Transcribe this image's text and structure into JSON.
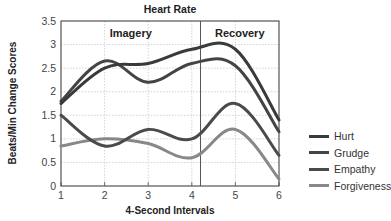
{
  "chart_data": {
    "type": "line",
    "title": "Heart Rate",
    "xlabel": "4-Second Intervals",
    "ylabel": "Beats/Min Change Scores",
    "x": [
      1,
      2,
      3,
      4,
      5,
      6
    ],
    "xlim": [
      1,
      6
    ],
    "ylim": [
      0,
      3.5
    ],
    "yticks": [
      "0",
      "0.5",
      "1",
      "1.5",
      "2",
      "2.5",
      "3",
      "3.5"
    ],
    "xticks": [
      "1",
      "2",
      "3",
      "4",
      "5",
      "6"
    ],
    "grid": true,
    "legend_position": "right",
    "annotations": [
      {
        "text": "Imagery",
        "region": "x 1 to 4.2"
      },
      {
        "text": "Recovery",
        "region": "x 4.2 to 6"
      }
    ],
    "divider_x": 4.2,
    "series": [
      {
        "name": "Hurt",
        "color": "#3a3a3a",
        "values": [
          1.75,
          2.5,
          2.6,
          2.9,
          2.9,
          1.4
        ]
      },
      {
        "name": "Grudge",
        "color": "#444444",
        "values": [
          1.8,
          2.65,
          2.2,
          2.6,
          2.55,
          1.15
        ]
      },
      {
        "name": "Empathy",
        "color": "#4a4a4a",
        "values": [
          1.5,
          0.85,
          1.2,
          1.0,
          1.75,
          0.65
        ]
      },
      {
        "name": "Forgiveness",
        "color": "#888888",
        "values": [
          0.85,
          1.0,
          0.9,
          0.6,
          1.2,
          0.15
        ]
      }
    ]
  }
}
